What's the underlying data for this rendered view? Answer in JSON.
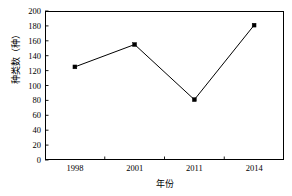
{
  "chart_data": {
    "type": "line",
    "title": "",
    "xlabel": "年份",
    "ylabel": "种类数（种）",
    "categories": [
      "1998",
      "2001",
      "2011",
      "2014"
    ],
    "values": [
      125,
      155,
      81,
      181
    ],
    "series": [
      {
        "name": "种类数",
        "values": [
          125,
          155,
          81,
          181
        ],
        "line_color": "#000000",
        "marker": "filled-square",
        "marker_color": "#000000"
      }
    ],
    "ylim": [
      0,
      200
    ],
    "yticks": [
      0,
      20,
      40,
      60,
      80,
      100,
      120,
      140,
      160,
      180,
      200
    ],
    "yticklabels": [
      "0",
      "20",
      "40",
      "60",
      "80",
      "100",
      "120",
      "140",
      "160",
      "180",
      "200"
    ],
    "xticklabels": [
      "1998",
      "2001",
      "2011",
      "2014"
    ],
    "grid": false,
    "legend": false,
    "legend_position": "none",
    "background_color": "#ffffff",
    "axis_color": "#000000"
  }
}
